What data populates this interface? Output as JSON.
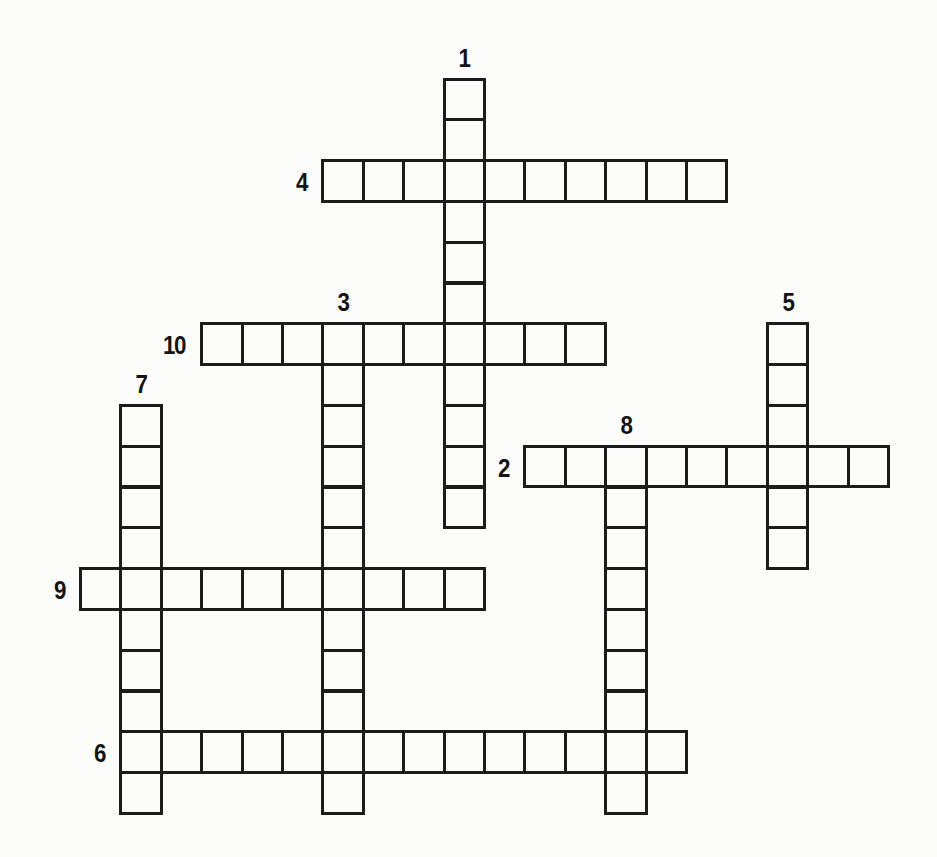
{
  "page": {
    "background": "#fcfcfb",
    "line_color": "#1c1c1c",
    "number_color": "#141414",
    "width": 937,
    "height": 857
  },
  "puzzle": {
    "kind": "freeform-crossword-grid",
    "grid": {
      "origin_x": 79,
      "origin_y": 77.5,
      "cell_w": 40.4,
      "cell_h": 40.8,
      "line_w": 3
    },
    "entries": [
      {
        "number": "1",
        "direction": "down",
        "row": 1,
        "col": 10,
        "length": 11,
        "label_pos": "above"
      },
      {
        "number": "2",
        "direction": "across",
        "row": 10,
        "col": 12,
        "length": 9,
        "label_pos": "left"
      },
      {
        "number": "3",
        "direction": "down",
        "row": 7,
        "col": 7,
        "length": 12,
        "label_pos": "above"
      },
      {
        "number": "4",
        "direction": "across",
        "row": 3,
        "col": 7,
        "length": 10,
        "label_pos": "left"
      },
      {
        "number": "5",
        "direction": "down",
        "row": 7,
        "col": 18,
        "length": 6,
        "label_pos": "above"
      },
      {
        "number": "6",
        "direction": "across",
        "row": 17,
        "col": 2,
        "length": 14,
        "label_pos": "left"
      },
      {
        "number": "7",
        "direction": "down",
        "row": 9,
        "col": 2,
        "length": 10,
        "label_pos": "above"
      },
      {
        "number": "8",
        "direction": "down",
        "row": 10,
        "col": 14,
        "length": 9,
        "label_pos": "above"
      },
      {
        "number": "9",
        "direction": "across",
        "row": 13,
        "col": 1,
        "length": 10,
        "label_pos": "left"
      },
      {
        "number": "10",
        "direction": "across",
        "row": 7,
        "col": 4,
        "length": 10,
        "label_pos": "left"
      }
    ]
  }
}
